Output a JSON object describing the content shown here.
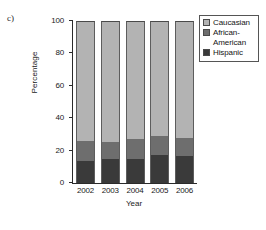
{
  "panel_label": "c)",
  "legend": {
    "items": [
      {
        "label": "Caucasian",
        "color": "#b3b3b3",
        "icon": "legend-swatch-icon"
      },
      {
        "label": "African-",
        "label_cont": "American",
        "color": "#6e6e6e",
        "icon": "legend-swatch-icon"
      },
      {
        "label": "Hispanic",
        "color": "#3a3a3a",
        "icon": "legend-swatch-icon"
      }
    ]
  },
  "axes": {
    "y_title": "Percentage",
    "x_title": "Year",
    "y_ticks": [
      "0",
      "20",
      "40",
      "60",
      "80",
      "100"
    ],
    "x_ticks": [
      "2002",
      "2003",
      "2004",
      "2005",
      "2006"
    ]
  },
  "chart_data": {
    "type": "bar",
    "stacked": true,
    "title": "",
    "xlabel": "Year",
    "ylabel": "Percentage",
    "ylim": [
      0,
      100
    ],
    "yticks": [
      0,
      20,
      40,
      60,
      80,
      100
    ],
    "grid": false,
    "legend_position": "right-top",
    "categories": [
      "2002",
      "2003",
      "2004",
      "2005",
      "2006"
    ],
    "series": [
      {
        "name": "Hispanic",
        "color": "#3a3a3a",
        "values": [
          13.5,
          15,
          15,
          17,
          16.5
        ]
      },
      {
        "name": "African-American",
        "color": "#6e6e6e",
        "values": [
          12.5,
          10.5,
          12,
          12,
          11.5
        ]
      },
      {
        "name": "Caucasian",
        "color": "#b3b3b3",
        "values": [
          74,
          74.5,
          73,
          71,
          72
        ]
      }
    ],
    "cumulative_tops": {
      "Hispanic": [
        13.5,
        15,
        15,
        17,
        16.5
      ],
      "African-American": [
        26,
        25.5,
        27,
        29,
        28
      ],
      "Caucasian": [
        100,
        100,
        100,
        100,
        100
      ]
    }
  }
}
